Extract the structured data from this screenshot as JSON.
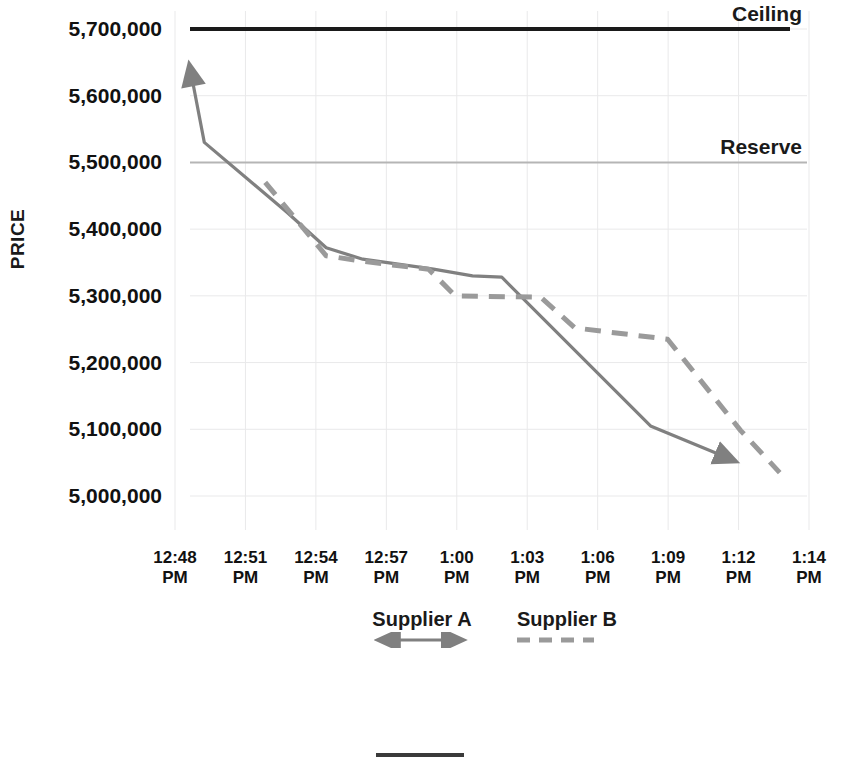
{
  "chart_data": {
    "type": "line",
    "title": "",
    "xlabel": "",
    "ylabel": "PRICE",
    "ylim": [
      4950000,
      5740000
    ],
    "y_ticks": [
      "5,700,000",
      "5,600,000",
      "5,500,000",
      "5,400,000",
      "5,300,000",
      "5,200,000",
      "5,100,000",
      "5,000,000"
    ],
    "y_tick_values": [
      5700000,
      5600000,
      5500000,
      5400000,
      5300000,
      5200000,
      5100000,
      5000000
    ],
    "x_ticks": [
      {
        "line1": "12:48",
        "line2": "PM"
      },
      {
        "line1": "12:51",
        "line2": "PM"
      },
      {
        "line1": "12:54",
        "line2": "PM"
      },
      {
        "line1": "12:57",
        "line2": "PM"
      },
      {
        "line1": "1:00",
        "line2": "PM"
      },
      {
        "line1": "1:03",
        "line2": "PM"
      },
      {
        "line1": "1:06",
        "line2": "PM"
      },
      {
        "line1": "1:09",
        "line2": "PM"
      },
      {
        "line1": "1:12",
        "line2": "PM"
      },
      {
        "line1": "1:14",
        "line2": "PM"
      }
    ],
    "x_range_minutes": [
      48,
      74
    ],
    "grid": true,
    "legend_position": "bottom",
    "series": [
      {
        "name": "Supplier A",
        "style": "solid",
        "color": "#808080",
        "marker": "arrow-both-ends",
        "points": [
          {
            "t": "12:48 PM",
            "x": 48.6,
            "y": 5645000
          },
          {
            "t": "12:49 PM",
            "x": 49.2,
            "y": 5530000
          },
          {
            "t": "12:53 PM",
            "x": 52.6,
            "y": 5425000
          },
          {
            "t": "12:54 PM",
            "x": 54.2,
            "y": 5372000
          },
          {
            "t": "12:56 PM",
            "x": 55.7,
            "y": 5355000
          },
          {
            "t": "12:59 PM",
            "x": 58.6,
            "y": 5340000
          },
          {
            "t": "1:00 PM",
            "x": 60.2,
            "y": 5330000
          },
          {
            "t": "1:01 PM",
            "x": 61.4,
            "y": 5328000
          },
          {
            "t": "1:07 PM",
            "x": 67.5,
            "y": 5105000
          },
          {
            "t": "1:11 PM",
            "x": 71.0,
            "y": 5052000
          }
        ]
      },
      {
        "name": "Supplier B",
        "style": "dashed",
        "color": "#9a9a9a",
        "marker": "none",
        "points": [
          {
            "t": "12:53 PM",
            "x": 51.7,
            "y": 5470000
          },
          {
            "t": "12:55 PM",
            "x": 54.2,
            "y": 5360000
          },
          {
            "t": "12:56 PM",
            "x": 55.7,
            "y": 5352000
          },
          {
            "t": "12:58 PM",
            "x": 57.2,
            "y": 5345000
          },
          {
            "t": "12:59 PM",
            "x": 58.4,
            "y": 5340000
          },
          {
            "t": "1:00 PM",
            "x": 59.5,
            "y": 5300000
          },
          {
            "t": "1:03 PM",
            "x": 63.0,
            "y": 5298000
          },
          {
            "t": "1:04 PM",
            "x": 64.4,
            "y": 5252000
          },
          {
            "t": "1:08 PM",
            "x": 68.2,
            "y": 5235000
          },
          {
            "t": "1:11 PM",
            "x": 71.2,
            "y": 5098000
          },
          {
            "t": "1:13 PM",
            "x": 72.8,
            "y": 5035000
          }
        ]
      }
    ],
    "reference_lines": [
      {
        "label": "Ceiling",
        "value": 5700000,
        "color": "#1a1a1a",
        "style": "solid",
        "width": 4
      },
      {
        "label": "Reserve",
        "value": 5500000,
        "color": "#b5b5b5",
        "style": "solid",
        "width": 2
      }
    ]
  },
  "legend": {
    "entries": [
      {
        "label": "Supplier A",
        "marker": "solid-double-arrow",
        "color": "#808080"
      },
      {
        "label": "Supplier B",
        "marker": "dashed-line",
        "color": "#9a9a9a"
      }
    ],
    "bottom_marker": {
      "marker": "solid-line",
      "color": "#3a3a3a"
    }
  },
  "colors": {
    "supplier_a": "#808080",
    "supplier_b": "#9a9a9a",
    "ceiling": "#1a1a1a",
    "reserve": "#b5b5b5",
    "grid": "#e9e9ea",
    "text": "#111111",
    "background": "#ffffff"
  }
}
